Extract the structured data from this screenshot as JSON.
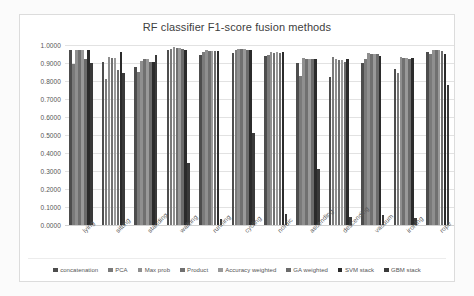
{
  "chart_data": {
    "type": "bar",
    "title": "RF classifier F1-score fusion methods",
    "xlabel": "",
    "ylabel": "",
    "ylim": [
      0.0,
      1.0
    ],
    "grid": true,
    "legend_position": "bottom",
    "ytick_labels": [
      "1.0000",
      "0.9000",
      "0.8000",
      "0.7000",
      "0.6000",
      "0.5000",
      "0.4000",
      "0.3000",
      "0.2000",
      "0.1000",
      "0.0000"
    ],
    "ytick_values": [
      1.0,
      0.9,
      0.8,
      0.7,
      0.6,
      0.5,
      0.4,
      0.3,
      0.2,
      0.1,
      0.0
    ],
    "categories": [
      "lying",
      "sitting",
      "standing",
      "walking",
      "running",
      "cycling",
      "nordic",
      "ascending",
      "descending",
      "vacuum",
      "ironing",
      "rope"
    ],
    "series": [
      {
        "name": "concatenation",
        "color": "#4d4d4d",
        "values": [
          0.97,
          0.905,
          0.88,
          0.975,
          0.945,
          0.955,
          0.94,
          0.9,
          0.82,
          0.9,
          0.865,
          0.96
        ]
      },
      {
        "name": "PCA",
        "color": "#7a7a7a",
        "values": [
          0.895,
          0.81,
          0.85,
          0.98,
          0.96,
          0.975,
          0.945,
          0.83,
          0.935,
          0.925,
          0.845,
          0.95
        ]
      },
      {
        "name": "Max prob",
        "color": "#8f8f8f",
        "values": [
          0.975,
          0.935,
          0.91,
          0.99,
          0.97,
          0.98,
          0.96,
          0.93,
          0.92,
          0.955,
          0.935,
          0.975
        ]
      },
      {
        "name": "Product",
        "color": "#707070",
        "values": [
          0.97,
          0.93,
          0.925,
          0.985,
          0.965,
          0.98,
          0.955,
          0.925,
          0.915,
          0.95,
          0.93,
          0.97
        ]
      },
      {
        "name": "Accuracy weighted",
        "color": "#999999",
        "values": [
          0.97,
          0.93,
          0.92,
          0.985,
          0.965,
          0.98,
          0.96,
          0.925,
          0.915,
          0.95,
          0.93,
          0.97
        ]
      },
      {
        "name": "GA weighted",
        "color": "#6b6b6b",
        "values": [
          0.92,
          0.86,
          0.905,
          0.98,
          0.965,
          0.975,
          0.955,
          0.92,
          0.905,
          0.95,
          0.925,
          0.965
        ]
      },
      {
        "name": "SVM stack",
        "color": "#2b2b2b",
        "values": [
          0.975,
          0.96,
          0.905,
          0.975,
          0.965,
          0.975,
          0.96,
          0.925,
          0.92,
          0.94,
          0.93,
          0.95
        ]
      },
      {
        "name": "GBM stack",
        "color": "#3a3a3a",
        "values": [
          0.9,
          0.845,
          0.945,
          0.345,
          0.035,
          0.51,
          0.06,
          0.31,
          0.045,
          0.055,
          0.04,
          0.78
        ]
      }
    ]
  },
  "legend": {
    "items": [
      {
        "label": "concatenation"
      },
      {
        "label": "PCA"
      },
      {
        "label": "Max prob"
      },
      {
        "label": "Product"
      },
      {
        "label": "Accuracy weighted"
      },
      {
        "label": "GA weighted"
      },
      {
        "label": "SVM stack"
      },
      {
        "label": "GBM stack"
      }
    ]
  }
}
